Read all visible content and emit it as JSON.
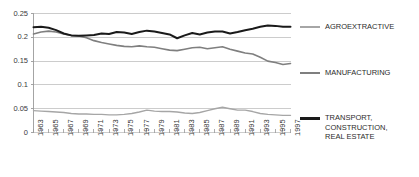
{
  "chart_data": {
    "type": "line",
    "title": "",
    "xlabel": "",
    "ylabel": "",
    "ylim": [
      0,
      0.25
    ],
    "ytick_labels": [
      "0",
      "0.05",
      "0.1",
      "0.15",
      "0.2",
      "0.25"
    ],
    "ytick_values": [
      0,
      0.05,
      0.1,
      0.15,
      0.2,
      0.25
    ],
    "grid": true,
    "legend_position": "right",
    "x": [
      1963,
      1964,
      1965,
      1966,
      1967,
      1968,
      1969,
      1970,
      1971,
      1972,
      1973,
      1974,
      1975,
      1976,
      1977,
      1978,
      1979,
      1980,
      1981,
      1982,
      1983,
      1984,
      1985,
      1986,
      1987,
      1988,
      1989,
      1990,
      1991,
      1992,
      1993,
      1994,
      1995,
      1996,
      1997
    ],
    "xtick_labels": [
      "1963",
      "1965",
      "1967",
      "1969",
      "1971",
      "1973",
      "1975",
      "1977",
      "1979",
      "1981",
      "1983",
      "1985",
      "1987",
      "1989",
      "1991",
      "1993",
      "1995",
      "1997"
    ],
    "series": [
      {
        "name": "AGROEXTRACTIVE",
        "color": "#a6a6a6",
        "width": 1.4,
        "values": [
          0.046,
          0.045,
          0.044,
          0.043,
          0.042,
          0.04,
          0.039,
          0.039,
          0.038,
          0.038,
          0.037,
          0.037,
          0.038,
          0.04,
          0.043,
          0.047,
          0.045,
          0.044,
          0.044,
          0.043,
          0.041,
          0.04,
          0.042,
          0.046,
          0.05,
          0.053,
          0.05,
          0.047,
          0.047,
          0.044,
          0.04,
          0.038,
          0.037,
          0.036,
          0.036
        ]
      },
      {
        "name": "MANUFACTURING",
        "color": "#7f7f7f",
        "width": 1.6,
        "values": [
          0.207,
          0.211,
          0.213,
          0.211,
          0.207,
          0.204,
          0.203,
          0.199,
          0.193,
          0.189,
          0.186,
          0.183,
          0.181,
          0.18,
          0.182,
          0.18,
          0.179,
          0.176,
          0.173,
          0.172,
          0.175,
          0.178,
          0.179,
          0.176,
          0.178,
          0.18,
          0.175,
          0.171,
          0.167,
          0.165,
          0.158,
          0.15,
          0.147,
          0.143,
          0.145
        ]
      },
      {
        "name": "TRANSPORT, CONSTRUCTION, REAL ESTATE",
        "color": "#1a1a1a",
        "width": 2.0,
        "values": [
          0.221,
          0.222,
          0.22,
          0.215,
          0.208,
          0.204,
          0.203,
          0.204,
          0.205,
          0.208,
          0.207,
          0.211,
          0.21,
          0.207,
          0.211,
          0.214,
          0.212,
          0.209,
          0.206,
          0.198,
          0.204,
          0.209,
          0.206,
          0.21,
          0.212,
          0.212,
          0.208,
          0.211,
          0.215,
          0.218,
          0.222,
          0.225,
          0.224,
          0.222,
          0.222
        ]
      }
    ]
  },
  "legend": {
    "items": [
      {
        "label": "AGROEXTRACTIVE"
      },
      {
        "label": "MANUFACTURING"
      },
      {
        "label": "TRANSPORT,\nCONSTRUCTION,\nREAL ESTATE"
      }
    ]
  }
}
